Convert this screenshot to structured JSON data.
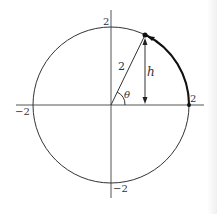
{
  "diagram": {
    "type": "unit-circle-angle",
    "circle_radius_label": "2",
    "axis_labels": {
      "x_pos": "2",
      "x_neg": "−2",
      "y_pos": "2",
      "y_neg": "−2"
    },
    "radius_label": "2",
    "height_label": "h",
    "angle_label": "θ",
    "colors": {
      "stroke": "#333333",
      "axis": "#555555",
      "arc": "#111111"
    }
  }
}
